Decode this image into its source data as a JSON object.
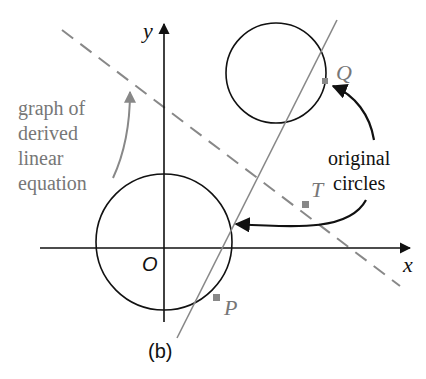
{
  "figure": {
    "panel_label": "(b)",
    "axes": {
      "x_label": "x",
      "y_label": "y",
      "origin_label": "O"
    },
    "points": {
      "P": "P",
      "Q": "Q",
      "T": "T"
    },
    "annotations": {
      "derived_line": [
        "graph of",
        "derived",
        "linear",
        "equation"
      ],
      "original_circles": [
        "original",
        "circles"
      ]
    },
    "colors": {
      "line_gray": "#888888",
      "text_gray": "#777777",
      "black": "#111111"
    }
  }
}
